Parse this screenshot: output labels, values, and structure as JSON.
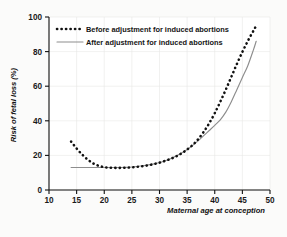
{
  "chart_data": {
    "type": "line",
    "title": "",
    "xlabel": "Maternal age at conception",
    "ylabel": "Risk of fetal loss (%)",
    "xlim": [
      10,
      50
    ],
    "ylim": [
      0,
      100
    ],
    "xticks": [
      10,
      15,
      20,
      25,
      30,
      35,
      40,
      45,
      50
    ],
    "yticks": [
      0,
      20,
      40,
      60,
      80,
      100
    ],
    "grid": true,
    "legend_position": "top-left",
    "series": [
      {
        "name": "Before adjustment for induced abortions",
        "style": "dashed",
        "color": "#111111",
        "x": [
          14,
          15,
          16,
          17,
          18,
          19,
          20,
          21,
          22,
          23,
          24,
          25,
          26,
          27,
          28,
          29,
          30,
          31,
          32,
          33,
          34,
          35,
          36,
          37,
          38,
          39,
          40,
          41,
          42,
          43,
          44,
          45,
          46,
          47,
          47.5
        ],
        "y": [
          28.0,
          24.0,
          20.5,
          17.6,
          15.4,
          14.0,
          13.2,
          12.9,
          12.8,
          12.8,
          12.9,
          13.1,
          13.4,
          13.8,
          14.3,
          15.0,
          15.8,
          16.8,
          18.0,
          19.4,
          21.2,
          23.4,
          26.0,
          29.4,
          33.6,
          38.6,
          44.4,
          51.0,
          58.0,
          65.4,
          72.8,
          79.8,
          86.2,
          92.0,
          95.0
        ]
      },
      {
        "name": "After adjustment for induced abortions",
        "style": "solid",
        "color": "#8d8d8d",
        "x": [
          14,
          15,
          16,
          17,
          18,
          19,
          20,
          21,
          22,
          23,
          24,
          25,
          26,
          27,
          28,
          29,
          30,
          31,
          32,
          33,
          34,
          35,
          36,
          37,
          38,
          39,
          40,
          41,
          42,
          43,
          44,
          45,
          46,
          47,
          47.5
        ],
        "y": [
          13.0,
          13.0,
          13.0,
          13.0,
          13.0,
          13.0,
          13.0,
          13.0,
          13.0,
          13.0,
          13.1,
          13.3,
          13.6,
          14.0,
          14.5,
          15.1,
          15.9,
          16.9,
          18.1,
          19.6,
          21.4,
          23.4,
          25.8,
          28.4,
          31.4,
          34.4,
          37.4,
          40.6,
          45.0,
          51.0,
          58.0,
          65.0,
          72.0,
          81.0,
          86.0
        ]
      }
    ]
  },
  "legend": {
    "items": [
      {
        "label": "Before adjustment for induced abortions"
      },
      {
        "label": "After adjustment for induced abortions"
      }
    ]
  },
  "axes": {
    "y_label": "Risk of fetal loss (%)",
    "x_label": "Maternal age at conception",
    "y_tick_labels": [
      "0",
      "20",
      "40",
      "60",
      "80",
      "100"
    ],
    "x_tick_labels": [
      "10",
      "15",
      "20",
      "25",
      "30",
      "35",
      "40",
      "45",
      "50"
    ]
  },
  "colors": {
    "before_series": "#111111",
    "after_series": "#8d8d8d",
    "axis": "#111111",
    "grid": "#e7e7e5",
    "page_background": "#fbfbfa",
    "plot_background": "#ffffff"
  }
}
